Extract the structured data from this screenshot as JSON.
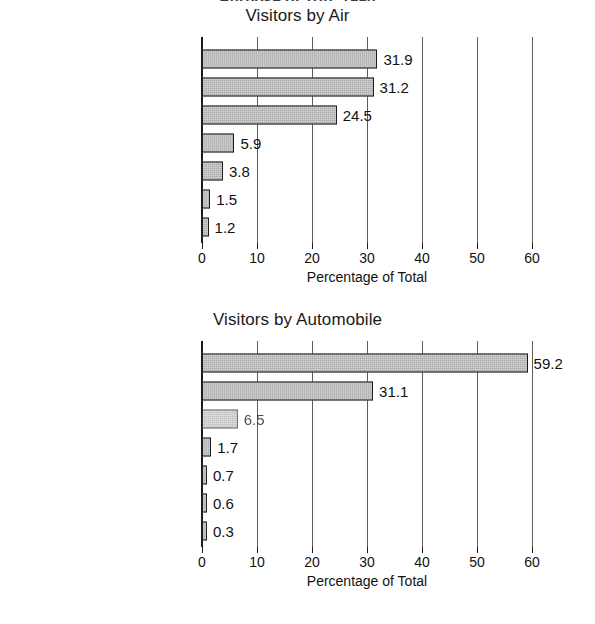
{
  "clipped_header": "Purpose of Trip, 1990",
  "axis": {
    "xlabel": "Percentage of Total",
    "ticks": [
      0,
      10,
      20,
      30,
      40,
      50,
      60
    ],
    "xmin": 0,
    "xmax": 60
  },
  "chart_data": [
    {
      "type": "bar",
      "orientation": "horizontal",
      "title": "Visitors by Air",
      "xlabel": "Percentage of Total",
      "ylabel": "",
      "xlim": [
        0,
        60
      ],
      "grid": true,
      "legend": "none",
      "categories": [
        "Visit friends/relatives",
        "Vacation",
        "Business",
        "Other",
        "Convention",
        "Cruise",
        "Honeymoon"
      ],
      "values": [
        31.9,
        31.2,
        24.5,
        5.9,
        3.8,
        1.5,
        1.2
      ],
      "labels": [
        "31.9",
        "31.2",
        "24.5",
        "5.9",
        "3.8",
        "1.5",
        "1.2"
      ]
    },
    {
      "type": "bar",
      "orientation": "horizontal",
      "title": "Visitors by Automobile",
      "xlabel": "Percentage of Total",
      "ylabel": "",
      "xlim": [
        0,
        60
      ],
      "grid": true,
      "legend": "none",
      "categories": [
        "Vacation",
        "Visit friends/relatives",
        "Business",
        "Other",
        "Honeymoon",
        "Convention",
        "Cruise"
      ],
      "values": [
        59.2,
        31.1,
        6.5,
        1.7,
        0.7,
        0.6,
        0.3
      ],
      "labels": [
        "59.2",
        "31.1",
        "6.5",
        "1.7",
        "0.7",
        "0.6",
        "0.3"
      ],
      "degraded_rows": [
        2
      ]
    }
  ],
  "colors": {
    "bar_fill": "#a9a9a9",
    "bar_stroke": "#1d1d1d",
    "gridline": "#5d5d5d",
    "axis": "#1b1b1b",
    "text": "#111111",
    "background": "#ffffff"
  }
}
